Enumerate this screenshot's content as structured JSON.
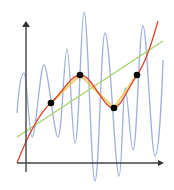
{
  "diagram": {
    "title": "Interpolation of data points",
    "axes": {
      "x_axis": "x",
      "y_axis": "y"
    },
    "colors": {
      "oscillating_polynomial": "#9fb0dc",
      "linear_fit": "#a6d46a",
      "piecewise_linear": "#e8c24a",
      "spline": "#d9482b",
      "points": "#000000",
      "axes": "#444444"
    },
    "points": [
      {
        "x": 51,
        "y": 103
      },
      {
        "x": 80,
        "y": 75
      },
      {
        "x": 114,
        "y": 108
      },
      {
        "x": 137,
        "y": 75
      }
    ],
    "curves": [
      {
        "name": "oscillating-curve",
        "color": "#9fb0dc"
      },
      {
        "name": "linear-regression-line",
        "color": "#a6d46a"
      },
      {
        "name": "piecewise-linear-curve",
        "color": "#e8c24a"
      },
      {
        "name": "smooth-interpolation-curve",
        "color": "#d9482b"
      }
    ]
  }
}
